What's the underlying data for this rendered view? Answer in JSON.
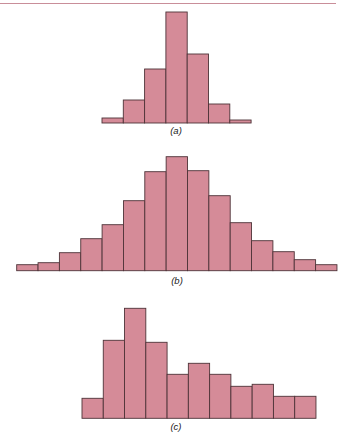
{
  "colors": {
    "bar_fill": "#d58b98",
    "bar_edge": "#4e3338",
    "top_rule": "#c98e99"
  },
  "chart_data": [
    {
      "type": "bar",
      "panel": "a",
      "title": "",
      "caption": "(a)",
      "xlabel": "",
      "ylabel": "",
      "grid": false,
      "note": "histogram, no axes; values are relative bar heights (px)",
      "categories": [
        1,
        2,
        3,
        4,
        5,
        6,
        7
      ],
      "values": [
        5,
        23,
        54,
        111,
        69,
        19,
        3
      ],
      "layout": {
        "x0": 102,
        "bin_width": 21.3,
        "baseline": 123
      }
    },
    {
      "type": "bar",
      "panel": "b",
      "title": "",
      "caption": "(b)",
      "xlabel": "",
      "ylabel": "",
      "grid": false,
      "note": "histogram, no axes; values are relative bar heights (px)",
      "categories": [
        1,
        2,
        3,
        4,
        5,
        6,
        7,
        8,
        9,
        10,
        11,
        12,
        13,
        14,
        15
      ],
      "values": [
        6,
        8,
        18,
        32,
        46,
        70,
        99,
        114,
        100,
        75,
        48,
        30,
        19,
        11,
        6
      ],
      "layout": {
        "x0": 16.7,
        "bin_width": 21.35,
        "baseline": 270.7
      }
    },
    {
      "type": "bar",
      "panel": "c",
      "title": "",
      "caption": "(c)",
      "xlabel": "",
      "ylabel": "",
      "grid": false,
      "note": "histogram, no axes; values are relative bar heights (px)",
      "categories": [
        1,
        2,
        3,
        4,
        5,
        6,
        7,
        8,
        9,
        10,
        11
      ],
      "values": [
        20,
        78,
        110,
        76,
        44,
        55,
        44,
        32,
        34,
        22,
        22
      ],
      "layout": {
        "x0": 82,
        "bin_width": 21.27,
        "baseline": 418.3
      }
    }
  ],
  "labels": {
    "a": "(a)",
    "b": "(b)",
    "c": "(c)"
  }
}
